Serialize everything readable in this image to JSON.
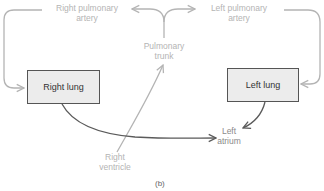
{
  "diagram": {
    "caption": "(b)",
    "colors": {
      "deoxygenated_path": "#b4b4b4",
      "oxygenated_path": "#5a5a5a",
      "box_fill": "#ececec",
      "box_border": "#555555"
    },
    "nodes": {
      "right_pulmonary_artery": {
        "line1": "Right pulmonary",
        "line2": "artery"
      },
      "left_pulmonary_artery": {
        "line1": "Left pulmonary",
        "line2": "artery"
      },
      "pulmonary_trunk": {
        "line1": "Pulmonary",
        "line2": "trunk"
      },
      "right_lung": {
        "label": "Right lung"
      },
      "left_lung": {
        "label": "Left lung"
      },
      "right_ventricle": {
        "line1": "Right",
        "line2": "ventricle"
      },
      "left_atrium": {
        "line1": "Left",
        "line2": "atrium"
      }
    },
    "edges": [
      {
        "from": "Right ventricle",
        "to": "Pulmonary trunk",
        "style": "light"
      },
      {
        "from": "Pulmonary trunk",
        "to": "Right pulmonary artery",
        "style": "light"
      },
      {
        "from": "Pulmonary trunk",
        "to": "Left pulmonary artery",
        "style": "light"
      },
      {
        "from": "Right pulmonary artery",
        "to": "Right lung",
        "style": "light"
      },
      {
        "from": "Left pulmonary artery",
        "to": "Left lung",
        "style": "light"
      },
      {
        "from": "Right lung",
        "to": "Left atrium",
        "style": "dark"
      },
      {
        "from": "Left lung",
        "to": "Left atrium",
        "style": "dark"
      }
    ]
  }
}
